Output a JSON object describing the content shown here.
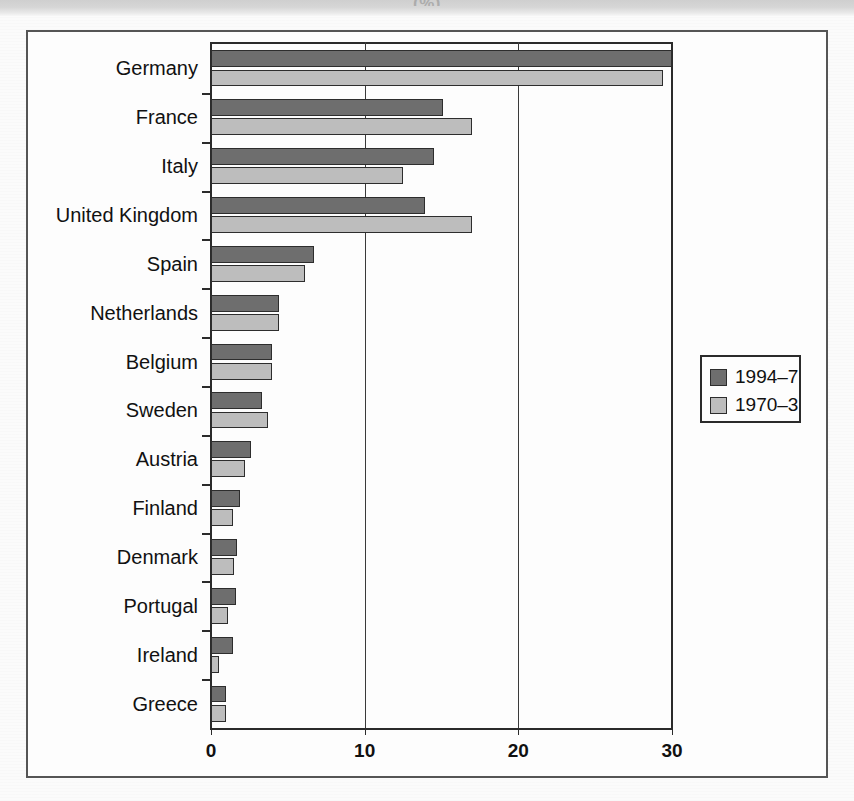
{
  "figure": {
    "top_caption_fragment": "(%)"
  },
  "chart_data": {
    "type": "bar",
    "orientation": "horizontal",
    "title": "",
    "subtitle": "",
    "xlabel": "",
    "ylabel": "",
    "xlim": [
      0,
      30
    ],
    "xticks": [
      0,
      10,
      20,
      30
    ],
    "xticklabels": [
      "0",
      "10",
      "20",
      "30"
    ],
    "grid": "vertical gridlines at 10 and 20",
    "legend_position": "right-middle",
    "categories": [
      "Germany",
      "France",
      "Italy",
      "United Kingdom",
      "Spain",
      "Netherlands",
      "Belgium",
      "Sweden",
      "Austria",
      "Finland",
      "Denmark",
      "Portugal",
      "Ireland",
      "Greece"
    ],
    "series": [
      {
        "name": "1994–7",
        "color": "#6e6e6e",
        "values": [
          30.0,
          15.1,
          14.5,
          13.9,
          6.7,
          4.4,
          4.0,
          3.3,
          2.6,
          1.9,
          1.7,
          1.6,
          1.4,
          1.0
        ]
      },
      {
        "name": "1970–3",
        "color": "#bdbdbd",
        "values": [
          29.4,
          17.0,
          12.5,
          17.0,
          6.1,
          4.4,
          4.0,
          3.7,
          2.2,
          1.4,
          1.5,
          1.1,
          0.5,
          1.0
        ]
      }
    ]
  },
  "legend": {
    "items": [
      {
        "label": "1994–7",
        "swatch": "dark"
      },
      {
        "label": "1970–3",
        "swatch": "light"
      }
    ]
  }
}
